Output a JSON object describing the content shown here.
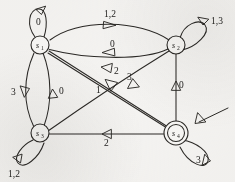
{
  "diagram": {
    "type": "state-transition-diagram",
    "ink_color": "#2b2926",
    "paper_color": "#f4f3f1",
    "states": [
      {
        "id": "s1",
        "label": "s",
        "subscript": "1",
        "x": 40,
        "y": 45,
        "accepting": false,
        "start": false
      },
      {
        "id": "s2",
        "label": "s",
        "subscript": "2",
        "x": 176,
        "y": 45,
        "accepting": false,
        "start": false
      },
      {
        "id": "s3",
        "label": "s",
        "subscript": "3",
        "x": 40,
        "y": 133,
        "accepting": false,
        "start": false
      },
      {
        "id": "s4",
        "label": "s",
        "subscript": "4",
        "x": 176,
        "y": 133,
        "accepting": true,
        "start": true
      }
    ],
    "self_loops": [
      {
        "id": "loop-s1",
        "state": "s1",
        "label": "0",
        "position": "top"
      },
      {
        "id": "loop-s2",
        "state": "s2",
        "label": "1,3",
        "position": "top-right"
      },
      {
        "id": "loop-s3",
        "state": "s3",
        "label": "1,2",
        "position": "bottom-left"
      },
      {
        "id": "loop-s4",
        "state": "s4",
        "label": "3",
        "position": "bottom-right"
      }
    ],
    "transitions": [
      {
        "id": "t-s1-s2",
        "from": "s1",
        "to": "s2",
        "label": "1,2",
        "route": "upper-arc"
      },
      {
        "id": "t-s2-s1",
        "from": "s2",
        "to": "s1",
        "label": "0",
        "route": "lower-arc"
      },
      {
        "id": "t-s1-s3",
        "from": "s1",
        "to": "s3",
        "label": "3",
        "route": "left-arc"
      },
      {
        "id": "t-s3-s1",
        "from": "s3",
        "to": "s1",
        "label": "0",
        "route": "right-arc"
      },
      {
        "id": "t-s4-s2",
        "from": "s4",
        "to": "s2",
        "label": "0",
        "route": "vertical"
      },
      {
        "id": "t-s4-s3",
        "from": "s4",
        "to": "s3",
        "label": "2",
        "route": "horizontal"
      },
      {
        "id": "t-s4-s1",
        "from": "s4",
        "to": "s1",
        "label": "2",
        "route": "diagonal"
      },
      {
        "id": "t-s1-s4",
        "from": "s1",
        "to": "s4",
        "label": "1",
        "route": "diagonal"
      },
      {
        "id": "t-s2-s3",
        "from": "s2",
        "to": "s3",
        "label": "3",
        "route": "diagonal-curve"
      }
    ],
    "start_marker": {
      "id": "start-arrow",
      "target": "s4",
      "direction": "from-upper-right"
    }
  }
}
